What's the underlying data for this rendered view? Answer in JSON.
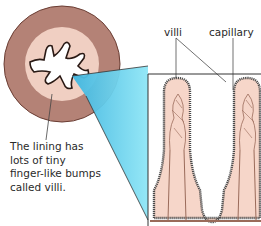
{
  "diagram": {
    "type": "cross-section with magnified inset",
    "labels": {
      "villi": "villi",
      "capillary": "capillary"
    },
    "caption_lines": [
      "The lining has",
      "lots of tiny",
      "finger-like bumps",
      "called villi."
    ],
    "colors": {
      "intestine_wall": "#b48276",
      "intestine_inner": "#f0cfc2",
      "lumen": "#ffffff",
      "magnify_beam": "#5fcde9",
      "villus_fill": "#f6d6c9",
      "villus_edge": "#555555",
      "capillary": "#9a6b5a",
      "frame": "#333333"
    }
  }
}
